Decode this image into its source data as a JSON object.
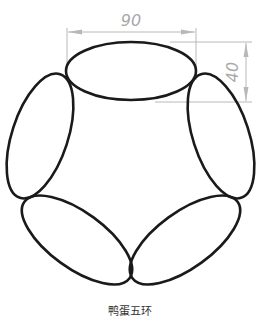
{
  "diagram": {
    "title": "鸭蛋五环",
    "dimensions": {
      "width_label": "90",
      "height_label": "40"
    },
    "colors": {
      "outline": "#1a1a1a",
      "dimension": "#b0b0b0",
      "background": "#ffffff"
    },
    "shapes": [
      {
        "name": "top-ellipse",
        "type": "ellipse"
      },
      {
        "name": "upper-left-ellipse",
        "type": "ellipse"
      },
      {
        "name": "upper-right-ellipse",
        "type": "ellipse"
      },
      {
        "name": "lower-left-ellipse",
        "type": "ellipse"
      },
      {
        "name": "lower-right-ellipse",
        "type": "ellipse"
      }
    ]
  }
}
